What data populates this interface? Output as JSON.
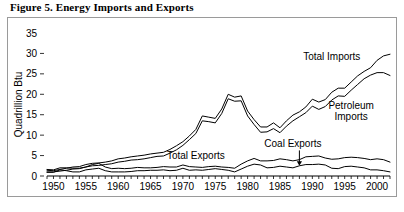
{
  "figure": {
    "title": "Figure 5. Energy Imports and Exports"
  },
  "chart_data": {
    "type": "line",
    "title": "Figure 5. Energy Imports and Exports",
    "xlabel": "",
    "ylabel": "Quadrillion Btu",
    "xlim": [
      1949,
      2002
    ],
    "ylim": [
      0,
      35
    ],
    "yticks": [
      0,
      5,
      10,
      15,
      20,
      25,
      30,
      35
    ],
    "ytick_labels": [
      "0",
      "5",
      "10",
      "15",
      "20",
      "25",
      "30",
      "35"
    ],
    "xticks": [
      1950,
      1955,
      1960,
      1965,
      1970,
      1975,
      1980,
      1985,
      1990,
      1995,
      2000
    ],
    "xtick_labels": [
      "1950",
      "1955",
      "1960",
      "1965",
      "1970",
      "1975",
      "1980",
      "1985",
      "1990",
      "1995",
      "2000"
    ],
    "minor_xticks": "annual",
    "grid": false,
    "legend": "annotations",
    "annotations": [
      {
        "text": "Total Imports",
        "x": 1993,
        "y": 28.5,
        "arrow": false
      },
      {
        "text": "Petroleum",
        "x": 1996,
        "y": 16.5,
        "arrow": false
      },
      {
        "text": "Imports",
        "x": 1996,
        "y": 13.8,
        "arrow": false
      },
      {
        "text": "Total Exports",
        "x": 1972,
        "y": 4.2,
        "arrow": false
      },
      {
        "text": "Coal Exports",
        "x": 1987,
        "y": 7.0,
        "arrow": true
      }
    ],
    "x": [
      1949,
      1950,
      1951,
      1952,
      1953,
      1954,
      1955,
      1956,
      1957,
      1958,
      1959,
      1960,
      1961,
      1962,
      1963,
      1964,
      1965,
      1966,
      1967,
      1968,
      1969,
      1970,
      1971,
      1972,
      1973,
      1974,
      1975,
      1976,
      1977,
      1978,
      1979,
      1980,
      1981,
      1982,
      1983,
      1984,
      1985,
      1986,
      1987,
      1988,
      1989,
      1990,
      1991,
      1992,
      1993,
      1994,
      1995,
      1996,
      1997,
      1998,
      1999,
      2000,
      2001,
      2002
    ],
    "series": [
      {
        "name": "Total Imports",
        "values": [
          1.4,
          1.3,
          1.6,
          1.9,
          2.2,
          2.3,
          2.8,
          3.1,
          3.2,
          3.4,
          3.7,
          4.2,
          4.4,
          4.7,
          4.9,
          5.1,
          5.4,
          5.6,
          5.8,
          6.5,
          7.4,
          8.4,
          9.8,
          11.4,
          14.7,
          14.4,
          14.1,
          16.4,
          20.0,
          19.3,
          19.6,
          15.9,
          13.8,
          12.0,
          12.0,
          13.0,
          11.8,
          13.5,
          14.9,
          15.7,
          16.9,
          18.8,
          18.1,
          18.7,
          20.5,
          21.5,
          21.5,
          23.0,
          24.5,
          25.6,
          26.5,
          28.3,
          29.4,
          29.8
        ]
      },
      {
        "name": "Petroleum Imports",
        "values": [
          1.0,
          1.0,
          1.2,
          1.4,
          1.7,
          1.8,
          2.2,
          2.5,
          2.6,
          2.8,
          3.0,
          3.4,
          3.6,
          3.9,
          4.0,
          4.2,
          4.5,
          4.8,
          4.9,
          5.6,
          6.4,
          7.5,
          8.9,
          10.4,
          13.5,
          13.3,
          13.0,
          15.3,
          18.9,
          18.3,
          18.4,
          14.7,
          12.6,
          10.7,
          10.8,
          11.6,
          10.6,
          12.2,
          13.5,
          14.5,
          15.5,
          17.1,
          16.3,
          17.0,
          18.6,
          19.6,
          19.5,
          21.0,
          22.4,
          23.8,
          24.7,
          25.3,
          25.3,
          24.6
        ]
      },
      {
        "name": "Total Exports",
        "values": [
          1.6,
          1.5,
          2.0,
          2.0,
          1.9,
          1.9,
          2.2,
          2.8,
          3.1,
          2.2,
          1.8,
          1.9,
          1.8,
          1.9,
          2.1,
          2.0,
          2.0,
          2.1,
          2.3,
          2.2,
          2.2,
          2.7,
          2.3,
          2.2,
          2.1,
          2.3,
          2.4,
          2.2,
          2.1,
          1.9,
          2.9,
          3.7,
          4.3,
          3.7,
          3.7,
          3.8,
          4.2,
          4.0,
          3.7,
          4.0,
          4.7,
          4.8,
          4.9,
          4.4,
          4.1,
          4.2,
          4.5,
          4.6,
          4.5,
          4.3,
          4.0,
          4.2,
          4.0,
          3.4
        ]
      },
      {
        "name": "Coal Exports",
        "values": [
          0.9,
          0.9,
          1.5,
          1.3,
          1.0,
          1.0,
          1.5,
          1.7,
          1.9,
          1.3,
          1.0,
          1.0,
          1.0,
          1.1,
          1.3,
          1.3,
          1.4,
          1.4,
          1.5,
          1.3,
          1.4,
          1.9,
          1.4,
          1.5,
          1.4,
          1.6,
          1.8,
          1.6,
          1.4,
          1.0,
          1.7,
          2.4,
          2.9,
          2.7,
          2.0,
          2.1,
          2.4,
          2.2,
          2.0,
          2.5,
          2.8,
          2.8,
          2.9,
          2.7,
          1.9,
          1.8,
          2.3,
          2.4,
          2.2,
          2.0,
          1.5,
          1.5,
          1.3,
          1.0
        ]
      }
    ]
  }
}
